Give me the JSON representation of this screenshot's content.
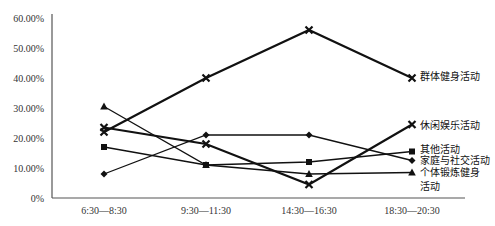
{
  "chart_data": {
    "type": "line",
    "title": "",
    "xlabel": "",
    "ylabel": "",
    "ylim": [
      0,
      60
    ],
    "yticks": [
      "0%",
      "10.00%",
      "20.00%",
      "30.00%",
      "40.00%",
      "50.00%",
      "60.00%"
    ],
    "categories": [
      "6:30—8:30",
      "9:30—11:30",
      "14:30—16:30",
      "18:30—20:30"
    ],
    "grid": false,
    "legend_position": "right, inline at line ends",
    "series": [
      {
        "name": "群体健身活动",
        "marker": "x",
        "values": [
          22,
          40,
          56,
          40
        ]
      },
      {
        "name": "休闲娱乐活动",
        "marker": "x",
        "values": [
          23.5,
          18,
          4.5,
          24.5
        ]
      },
      {
        "name": "其他活动",
        "marker": "square",
        "values": [
          17,
          11,
          12,
          15.5
        ]
      },
      {
        "name": "家庭与社交活动",
        "marker": "diamond",
        "values": [
          8,
          21,
          21,
          12.5
        ]
      },
      {
        "name": "个体锻炼健身活动",
        "marker": "triangle",
        "values": [
          30.5,
          11,
          8,
          8.5
        ]
      }
    ]
  },
  "legend": {
    "labels": [
      {
        "lines": [
          "群体健身活动"
        ],
        "y": 80
      },
      {
        "lines": [
          "休闲娱乐活动"
        ],
        "y": 129
      },
      {
        "lines": [
          "其他活动"
        ],
        "y": 153
      },
      {
        "lines": [
          "家庭与社交活动"
        ],
        "y": 164
      },
      {
        "lines": [
          "个体锻炼健身",
          "活动"
        ],
        "y": 176
      }
    ]
  }
}
